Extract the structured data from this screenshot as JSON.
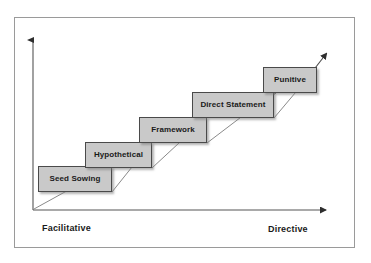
{
  "diagram": {
    "type": "staircase",
    "colors": {
      "box_fill": "#c9c9c9",
      "box_border": "#4a4a4a",
      "axis": "#3a3a3a",
      "frame": "#9a9a9a",
      "text": "#1a1a1a",
      "background": "#ffffff"
    },
    "steps": [
      {
        "label": "Seed Sowing",
        "order": 1
      },
      {
        "label": "Hypothetical",
        "order": 2
      },
      {
        "label": "Framework",
        "order": 3
      },
      {
        "label": "Direct Statement",
        "order": 4
      },
      {
        "label": "Punitive",
        "order": 5
      }
    ],
    "axes": {
      "x_left_label": "Facilitative",
      "x_right_label": "Directive",
      "y_arrow": "up",
      "x_arrow": "right"
    },
    "trend": {
      "direction": "ascending",
      "arrow": "up-right"
    }
  }
}
